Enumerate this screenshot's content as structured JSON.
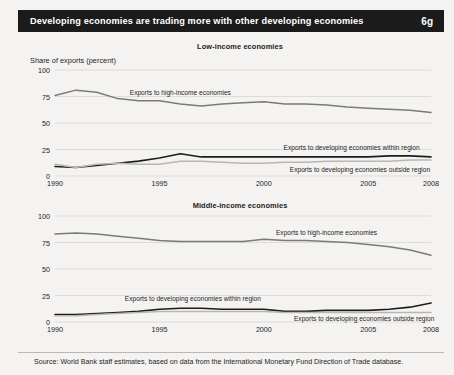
{
  "header": {
    "title": "Developing economies are trading more with other developing economies",
    "number": "6g"
  },
  "axis_caption": "Share of exports (percent)",
  "footer": {
    "source": "Source: World Bank staff estimates, based on data from the International Monetary Fund Direction of Trade database."
  },
  "colors": {
    "header_bg": "#1b1b1b",
    "header_text": "#ffffff",
    "page_bg": "#f4f3f1",
    "grid": "#d2d1cd",
    "high_income_line": "#7a7a78",
    "within_region_line": "#1d1d1d",
    "outside_region_line": "#b8b7b3"
  },
  "yticks": [
    "0",
    "25",
    "50",
    "75",
    "100"
  ],
  "xticks": [
    "1990",
    "1995",
    "2000",
    "2005",
    "2008"
  ],
  "labels": {
    "high_income": "Exports to high-income economies",
    "within_region": "Exports to developing economies within region",
    "outside_region": "Exports to developing economies outside region"
  },
  "chart_data": [
    {
      "type": "line",
      "title": "Low-income economies",
      "xlabel": "",
      "ylabel": "Share of exports (percent)",
      "xlim": [
        1990,
        2008
      ],
      "ylim": [
        0,
        100
      ],
      "yticks": [
        0,
        25,
        50,
        75,
        100
      ],
      "xticks": [
        1990,
        1995,
        2000,
        2005,
        2008
      ],
      "grid": true,
      "legend": "inline-annotations",
      "x": [
        1990,
        1991,
        1992,
        1993,
        1994,
        1995,
        1996,
        1997,
        1998,
        1999,
        2000,
        2001,
        2002,
        2003,
        2004,
        2005,
        2006,
        2007,
        2008
      ],
      "series": [
        {
          "name": "Exports to high-income economies",
          "values": [
            76,
            81,
            79,
            73,
            71,
            71,
            68,
            66,
            68,
            69,
            70,
            68,
            68,
            67,
            65,
            64,
            63,
            62,
            60
          ]
        },
        {
          "name": "Exports to developing economies within region",
          "values": [
            9,
            8,
            10,
            12,
            14,
            17,
            21,
            18,
            18,
            18,
            18,
            18,
            18,
            18,
            18,
            18,
            19,
            19,
            18
          ]
        },
        {
          "name": "Exports to developing economies outside region",
          "values": [
            11,
            8,
            11,
            12,
            11,
            11,
            14,
            14,
            13,
            12,
            12,
            13,
            13,
            14,
            14,
            14,
            14,
            15,
            15
          ]
        }
      ]
    },
    {
      "type": "line",
      "title": "Middle-income economies",
      "xlabel": "",
      "ylabel": "Share of exports (percent)",
      "xlim": [
        1990,
        2008
      ],
      "ylim": [
        0,
        100
      ],
      "yticks": [
        0,
        25,
        50,
        75,
        100
      ],
      "xticks": [
        1990,
        1995,
        2000,
        2005,
        2008
      ],
      "grid": true,
      "legend": "inline-annotations",
      "x": [
        1990,
        1991,
        1992,
        1993,
        1994,
        1995,
        1996,
        1997,
        1998,
        1999,
        2000,
        2001,
        2002,
        2003,
        2004,
        2005,
        2006,
        2007,
        2008
      ],
      "series": [
        {
          "name": "Exports to high-income economies",
          "values": [
            83,
            84,
            83,
            81,
            79,
            77,
            76,
            76,
            76,
            76,
            78,
            77,
            77,
            76,
            75,
            73,
            71,
            68,
            63
          ]
        },
        {
          "name": "Exports to developing economies within region",
          "values": [
            7,
            7,
            8,
            9,
            10,
            12,
            13,
            13,
            12,
            12,
            12,
            10,
            10,
            11,
            11,
            11,
            12,
            14,
            18
          ]
        },
        {
          "name": "Exports to developing economies outside region",
          "values": [
            6,
            6,
            7,
            8,
            9,
            10,
            10,
            10,
            10,
            10,
            10,
            9,
            9,
            9,
            9,
            9,
            9,
            9,
            9
          ]
        }
      ]
    }
  ]
}
